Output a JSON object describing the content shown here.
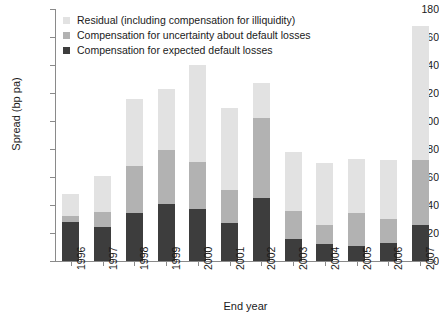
{
  "chart_data": {
    "type": "bar",
    "subtype": "stacked",
    "title": "",
    "xlabel": "End year",
    "ylabel": "Spread (bp pa)",
    "categories": [
      "1996",
      "1997",
      "1998",
      "1999",
      "2000",
      "2001",
      "2002",
      "2003",
      "2004",
      "2005",
      "2006",
      "2007"
    ],
    "series": [
      {
        "name": "Compensation for expected default losses",
        "color": "#3d3d3d",
        "values": [
          28,
          24,
          34,
          41,
          37,
          27,
          45,
          16,
          12,
          11,
          13,
          26
        ]
      },
      {
        "name": "Compensation for uncertainty about default losses",
        "color": "#b2b2b2",
        "values": [
          4,
          11,
          34,
          38,
          34,
          24,
          57,
          20,
          14,
          23,
          17,
          46
        ]
      },
      {
        "name": "Residual (including compensation for illiquidity)",
        "color": "#e2e2e2",
        "values": [
          16,
          26,
          48,
          44,
          69,
          58,
          25,
          42,
          44,
          39,
          42,
          96
        ]
      }
    ],
    "totals": [
      48,
      61,
      116,
      123,
      140,
      109,
      127,
      78,
      70,
      73,
      72,
      168
    ],
    "ylim": [
      0,
      180
    ],
    "yticks": [
      0,
      20,
      40,
      60,
      80,
      100,
      120,
      140,
      160,
      180
    ],
    "ytick_labels": [
      "0",
      "20",
      "40",
      "60",
      "80",
      "100",
      "120",
      "140",
      "160",
      "180"
    ],
    "grid": false,
    "legend_position": "top-left"
  },
  "legend": {
    "items": [
      {
        "label": "Residual (including compensation for illiquidity)",
        "swatch": "#e2e2e2",
        "name": "legend-swatch-residual"
      },
      {
        "label": "Compensation for uncertainty about default losses",
        "swatch": "#b2b2b2",
        "name": "legend-swatch-uncertainty"
      },
      {
        "label": "Compensation for expected default losses",
        "swatch": "#3d3d3d",
        "name": "legend-swatch-expected"
      }
    ]
  },
  "axes": {
    "y_title": "Spread (bp pa)",
    "x_title": "End year"
  }
}
